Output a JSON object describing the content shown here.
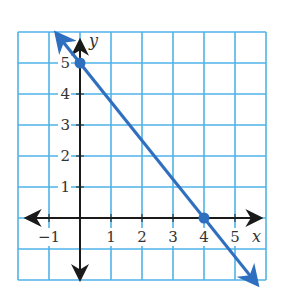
{
  "chart_data": {
    "type": "line",
    "title": "",
    "xlabel": "x",
    "ylabel": "y",
    "xlim": [
      -2,
      6
    ],
    "ylim": [
      -2,
      6
    ],
    "grid": true,
    "x_ticks": [
      "−1",
      "1",
      "2",
      "3",
      "4",
      "5"
    ],
    "y_ticks": [
      "1",
      "2",
      "3",
      "4",
      "5"
    ],
    "series": [
      {
        "name": "line",
        "equation": "y = -5/4 x + 5",
        "points": [
          {
            "x": 0,
            "y": 5
          },
          {
            "x": 4,
            "y": 0
          }
        ],
        "arrows_both_ends": true
      }
    ],
    "colors": {
      "grid": "#4fb3e8",
      "line": "#2f6fbf",
      "axes": "#1a1a1a"
    }
  }
}
